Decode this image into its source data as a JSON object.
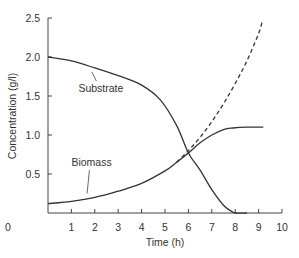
{
  "chart_data": {
    "type": "line",
    "title": "",
    "xlabel": "Time (h)",
    "ylabel": "Concentration (g/l)",
    "xlim": [
      0,
      10
    ],
    "ylim": [
      0,
      2.5
    ],
    "x_ticks": [
      0,
      1,
      2,
      3,
      4,
      5,
      6,
      7,
      8,
      9,
      10
    ],
    "x_tick_labels": [
      "0",
      "1",
      "2",
      "3",
      "4",
      "5",
      "6",
      "7",
      "8",
      "9",
      "10"
    ],
    "y_ticks": [
      0.5,
      1.0,
      1.5,
      2.0,
      2.5
    ],
    "y_tick_labels": [
      "0.5",
      "1.0",
      "1.5",
      "2.0",
      "2.5"
    ],
    "grid": false,
    "legend": "none (inline annotations)",
    "series": [
      {
        "name": "Substrate",
        "style": "solid",
        "x": [
          0,
          1,
          2,
          3,
          4,
          4.8,
          5.5,
          6,
          6.5,
          7,
          7.5,
          7.8,
          8,
          8.5
        ],
        "y": [
          2.0,
          1.95,
          1.86,
          1.76,
          1.64,
          1.45,
          1.12,
          0.77,
          0.55,
          0.3,
          0.1,
          0.03,
          0.0,
          0.0
        ]
      },
      {
        "name": "Biomass",
        "style": "solid",
        "x": [
          0,
          1,
          2,
          3,
          4,
          5,
          5.5,
          6,
          6.5,
          7,
          7.5,
          7.9,
          8.5,
          9.2
        ],
        "y": [
          0.12,
          0.15,
          0.2,
          0.28,
          0.38,
          0.54,
          0.65,
          0.77,
          0.9,
          1.0,
          1.07,
          1.09,
          1.1,
          1.1
        ]
      },
      {
        "name": "Biomass (unlimited growth)",
        "style": "dashed",
        "x": [
          5.5,
          6,
          6.5,
          7,
          7.5,
          8,
          8.5,
          9,
          9.15
        ],
        "y": [
          0.65,
          0.8,
          0.97,
          1.17,
          1.4,
          1.66,
          1.95,
          2.3,
          2.45
        ]
      }
    ],
    "annotations": [
      {
        "text": "Substrate",
        "x": 1.3,
        "y": 1.55,
        "points_to": {
          "x": 2.0,
          "y": 1.86
        }
      },
      {
        "text": "Biomass",
        "x": 1.0,
        "y": 0.6,
        "points_to": {
          "x": 1.8,
          "y": 0.2
        }
      }
    ]
  }
}
